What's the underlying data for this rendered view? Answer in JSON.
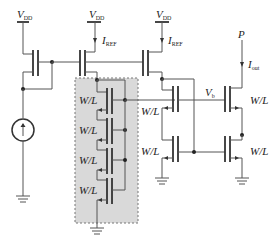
{
  "labels": {
    "vdd_left": {
      "main": "V",
      "sub": "DD"
    },
    "vdd_mid": {
      "main": "V",
      "sub": "DD"
    },
    "vdd_right": {
      "main": "V",
      "sub": "DD"
    },
    "iref_mid": {
      "main": "I",
      "sub": "REF"
    },
    "iref_right": {
      "main": "I",
      "sub": "REF"
    },
    "p_node": "P",
    "iout": {
      "main": "I",
      "sub": "out"
    },
    "vb": {
      "main": "V",
      "sub": "b"
    },
    "stack_wl": [
      "W/L",
      "W/L",
      "W/L",
      "W/L"
    ],
    "cascode_left_wl": "W/L",
    "cascode_right_wl": "W/L",
    "mirror_left_wl": "W/L",
    "mirror_right_wl": "W/L"
  },
  "colors": {
    "shaded_box_fill": "#d9d9d9",
    "shaded_box_border": "#777777",
    "wire": "#555555"
  }
}
